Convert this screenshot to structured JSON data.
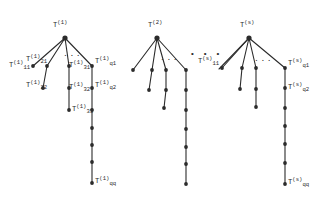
{
  "figure": {
    "type": "diagram",
    "ink_color": "#2b2b2b",
    "background": "#ffffff",
    "width": 331,
    "height": 212
  },
  "trees": [
    {
      "id": "tree-1",
      "root": {
        "base": "T",
        "sup": "(1)",
        "sub": "",
        "x": 65,
        "y": 38,
        "label_x": 53,
        "label_y": 22
      },
      "branch_dots": {
        "text": "...",
        "x": 63,
        "y": 50
      },
      "nodes": [
        {
          "name": "n-1-11",
          "x": 33,
          "y": 66,
          "label": {
            "base": "T",
            "sup": "(1)",
            "sub": "11"
          },
          "label_x": 9,
          "label_y": 62
        },
        {
          "name": "n-1-21",
          "x": 47,
          "y": 66,
          "label": {
            "base": "T",
            "sup": "(1)",
            "sub": "21"
          },
          "label_x": 26,
          "label_y": 56
        },
        {
          "name": "n-1-22",
          "x": 43,
          "y": 88,
          "label": {
            "base": "T",
            "sup": "(1)",
            "sub": "22"
          },
          "label_x": 26,
          "label_y": 82
        },
        {
          "name": "n-1-31",
          "x": 69,
          "y": 66,
          "label": {
            "base": "T",
            "sup": "(1)",
            "sub": "31"
          },
          "label_x": 69,
          "label_y": 62
        },
        {
          "name": "n-1-32",
          "x": 69,
          "y": 88,
          "label": {
            "base": "T",
            "sup": "(1)",
            "sub": "32"
          },
          "label_x": 69,
          "label_y": 84
        },
        {
          "name": "n-1-33",
          "x": 69,
          "y": 110,
          "label": {
            "base": "T",
            "sup": "(1)",
            "sub": "33"
          },
          "label_x": 72,
          "label_y": 106
        },
        {
          "name": "n-1-q1",
          "x": 92,
          "y": 66,
          "label": {
            "base": "T",
            "sup": "(1)",
            "sub": "q1"
          },
          "label_x": 95,
          "label_y": 58
        },
        {
          "name": "n-1-q2",
          "x": 92,
          "y": 88,
          "label": {
            "base": "T",
            "sup": "(1)",
            "sub": "q2"
          },
          "label_x": 95,
          "label_y": 82
        },
        {
          "name": "n-1-q3",
          "x": 92,
          "y": 110,
          "label": null
        },
        {
          "name": "n-1-q4",
          "x": 92,
          "y": 128,
          "label": null
        },
        {
          "name": "n-1-q5",
          "x": 92,
          "y": 145,
          "label": null
        },
        {
          "name": "n-1-q6",
          "x": 92,
          "y": 162,
          "label": null
        },
        {
          "name": "n-1-qq",
          "x": 92,
          "y": 183,
          "label": {
            "base": "T",
            "sup": "(1)",
            "sub": "qq"
          },
          "label_x": 95,
          "label_y": 178
        }
      ],
      "edges": [
        [
          65,
          38,
          33,
          66
        ],
        [
          65,
          38,
          47,
          66
        ],
        [
          65,
          38,
          69,
          66
        ],
        [
          65,
          38,
          92,
          66
        ],
        [
          47,
          66,
          43,
          88
        ],
        [
          69,
          66,
          69,
          88
        ],
        [
          69,
          88,
          69,
          110
        ],
        [
          92,
          66,
          92,
          88
        ],
        [
          92,
          88,
          92,
          110
        ],
        [
          92,
          110,
          92,
          128
        ],
        [
          92,
          128,
          92,
          145
        ],
        [
          92,
          145,
          92,
          162
        ],
        [
          92,
          162,
          92,
          183
        ]
      ]
    },
    {
      "id": "tree-2",
      "root": {
        "base": "T",
        "sup": "(2)",
        "sub": "",
        "x": 157,
        "y": 38,
        "label_x": 148,
        "label_y": 22
      },
      "branch_dots": {
        "text": "...",
        "x": 160,
        "y": 54
      },
      "nodes": [
        {
          "name": "n-2-11",
          "x": 133,
          "y": 70,
          "label": null
        },
        {
          "name": "n-2-21",
          "x": 152,
          "y": 70,
          "label": null
        },
        {
          "name": "n-2-22",
          "x": 149,
          "y": 90,
          "label": null
        },
        {
          "name": "n-2-31",
          "x": 166,
          "y": 70,
          "label": null
        },
        {
          "name": "n-2-32",
          "x": 166,
          "y": 90,
          "label": null
        },
        {
          "name": "n-2-33",
          "x": 164,
          "y": 108,
          "label": null
        },
        {
          "name": "n-2-q1",
          "x": 186,
          "y": 70,
          "label": null
        },
        {
          "name": "n-2-q2",
          "x": 186,
          "y": 90,
          "label": null
        },
        {
          "name": "n-2-q3",
          "x": 186,
          "y": 110,
          "label": null
        },
        {
          "name": "n-2-q4",
          "x": 186,
          "y": 129,
          "label": null
        },
        {
          "name": "n-2-q5",
          "x": 186,
          "y": 147,
          "label": null
        },
        {
          "name": "n-2-q6",
          "x": 186,
          "y": 164,
          "label": null
        },
        {
          "name": "n-2-qq",
          "x": 186,
          "y": 184,
          "label": null
        }
      ],
      "edges": [
        [
          157,
          38,
          133,
          70
        ],
        [
          157,
          38,
          152,
          70
        ],
        [
          157,
          38,
          166,
          70
        ],
        [
          157,
          38,
          186,
          70
        ],
        [
          152,
          70,
          149,
          90
        ],
        [
          166,
          70,
          166,
          90
        ],
        [
          166,
          90,
          164,
          108
        ],
        [
          186,
          70,
          186,
          90
        ],
        [
          186,
          90,
          186,
          110
        ],
        [
          186,
          110,
          186,
          129
        ],
        [
          186,
          129,
          186,
          147
        ],
        [
          186,
          147,
          186,
          164
        ],
        [
          186,
          164,
          186,
          184
        ]
      ]
    },
    {
      "id": "tree-s",
      "root": {
        "base": "T",
        "sup": "(s)",
        "sub": "",
        "x": 249,
        "y": 38,
        "label_x": 240,
        "label_y": 22
      },
      "branch_dots": {
        "text": "...",
        "x": 254,
        "y": 55
      },
      "nodes": [
        {
          "name": "n-s-11",
          "x": 222,
          "y": 68,
          "label": {
            "base": "T",
            "sup": "(s)",
            "sub": "11"
          },
          "label_x": 198,
          "label_y": 58
        },
        {
          "name": "n-s-21",
          "x": 242,
          "y": 68,
          "label": null
        },
        {
          "name": "n-s-22",
          "x": 240,
          "y": 89,
          "label": null
        },
        {
          "name": "n-s-31",
          "x": 256,
          "y": 68,
          "label": null
        },
        {
          "name": "n-s-32",
          "x": 256,
          "y": 89,
          "label": null
        },
        {
          "name": "n-s-33",
          "x": 256,
          "y": 107,
          "label": null
        },
        {
          "name": "n-s-q1",
          "x": 285,
          "y": 68,
          "label": {
            "base": "T",
            "sup": "(s)",
            "sub": "q1"
          },
          "label_x": 288,
          "label_y": 60
        },
        {
          "name": "n-s-q2",
          "x": 285,
          "y": 88,
          "label": {
            "base": "T",
            "sup": "(s)",
            "sub": "q2"
          },
          "label_x": 288,
          "label_y": 84
        },
        {
          "name": "n-s-q3",
          "x": 285,
          "y": 108,
          "label": null
        },
        {
          "name": "n-s-q4",
          "x": 285,
          "y": 126,
          "label": null
        },
        {
          "name": "n-s-q5",
          "x": 285,
          "y": 144,
          "label": null
        },
        {
          "name": "n-s-q6",
          "x": 285,
          "y": 163,
          "label": null
        },
        {
          "name": "n-s-qq",
          "x": 285,
          "y": 184,
          "label": {
            "base": "T",
            "sup": "(s)",
            "sub": "qq"
          },
          "label_x": 288,
          "label_y": 179
        }
      ],
      "edges": [
        [
          249,
          38,
          222,
          68
        ],
        [
          249,
          38,
          242,
          68
        ],
        [
          249,
          38,
          256,
          68
        ],
        [
          249,
          38,
          285,
          68
        ],
        [
          242,
          68,
          240,
          89
        ],
        [
          256,
          68,
          256,
          89
        ],
        [
          256,
          89,
          256,
          107
        ],
        [
          285,
          68,
          285,
          88
        ],
        [
          285,
          88,
          285,
          108
        ],
        [
          285,
          108,
          285,
          126
        ],
        [
          285,
          126,
          285,
          144
        ],
        [
          285,
          144,
          285,
          163
        ],
        [
          285,
          163,
          285,
          184
        ]
      ]
    }
  ],
  "inter_tree_dots": {
    "text": "•  •  •",
    "x": 190,
    "y": 50
  },
  "tree_s_11_connector": [
    [
      219,
      69
    ],
    [
      249,
      38
    ]
  ]
}
